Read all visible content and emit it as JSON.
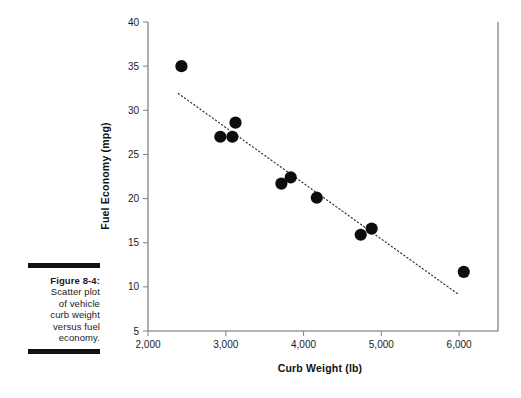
{
  "caption": {
    "figure_label": "Figure 8-4:",
    "lines": [
      "Scatter plot",
      "of vehicle",
      "curb weight",
      "versus fuel",
      "economy."
    ],
    "rule_color": "#111111"
  },
  "chart_data": {
    "type": "scatter",
    "title": "",
    "xlabel": "Curb Weight (lb)",
    "ylabel": "Fuel Economy (mpg)",
    "xlim": [
      2000,
      6500
    ],
    "ylim": [
      5,
      40
    ],
    "xticks": [
      2000,
      3000,
      4000,
      5000,
      6000
    ],
    "xticklabels": [
      "2,000",
      "3,000",
      "4,000",
      "5,000",
      "6,000"
    ],
    "yticks": [
      5,
      10,
      15,
      20,
      25,
      30,
      35,
      40
    ],
    "yticklabels": [
      "5",
      "10",
      "15",
      "20",
      "25",
      "30",
      "35",
      "40"
    ],
    "grid": false,
    "legend": false,
    "marker_color": "#0d0d0d",
    "points": [
      {
        "x": 2430,
        "y": 35.0
      },
      {
        "x": 2930,
        "y": 27.0
      },
      {
        "x": 3085,
        "y": 27.0
      },
      {
        "x": 3125,
        "y": 28.6
      },
      {
        "x": 3715,
        "y": 21.7
      },
      {
        "x": 3835,
        "y": 22.4
      },
      {
        "x": 4170,
        "y": 20.1
      },
      {
        "x": 4735,
        "y": 15.9
      },
      {
        "x": 4875,
        "y": 16.6
      },
      {
        "x": 6060,
        "y": 11.7
      }
    ],
    "trendline": {
      "style": "dotted",
      "color": "#2b2b2b",
      "x_start": 2390,
      "y_start": 31.9,
      "x_end": 6000,
      "y_end": 9.1
    }
  }
}
